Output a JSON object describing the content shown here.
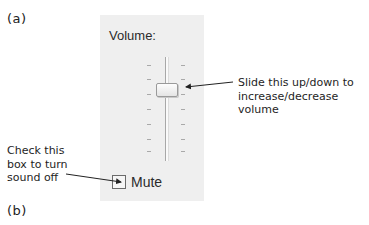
{
  "figure_labels": {
    "a": "(a)",
    "b": "(b)"
  },
  "volume_panel": {
    "title": "Volume:",
    "slider": {
      "orientation": "vertical",
      "tick_count": 7,
      "thumb_position_from_top_fraction": 0.27
    },
    "mute": {
      "label": "Mute",
      "checked": false
    }
  },
  "annotations": {
    "slider": "Slide this up/down to\nincrease/decrease\nvolume",
    "mute": "Check this\nbox to turn\nsound off"
  },
  "colors": {
    "panel_bg": "#efefef",
    "text": "#1e1e1e",
    "arrow": "#222222"
  }
}
